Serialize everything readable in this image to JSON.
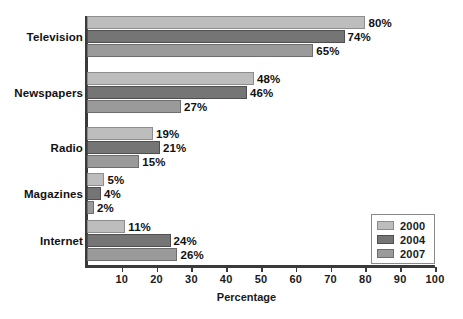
{
  "chart_data": {
    "type": "bar",
    "orientation": "horizontal",
    "title": "",
    "xlabel": "Percentage",
    "ylabel": "",
    "xlim": [
      0,
      100
    ],
    "xticks": [
      10,
      20,
      30,
      40,
      50,
      60,
      70,
      80,
      90,
      100
    ],
    "grid": false,
    "legend_position": "bottom-right",
    "categories": [
      "Television",
      "Newspapers",
      "Radio",
      "Magazines",
      "Internet"
    ],
    "series": [
      {
        "name": "2000",
        "color": "#bdbdbd",
        "values": [
          80,
          48,
          19,
          5,
          11
        ],
        "labels": [
          "80%",
          "48%",
          "19%",
          "5%",
          "11%"
        ]
      },
      {
        "name": "2004",
        "color": "#757575",
        "values": [
          74,
          46,
          21,
          4,
          24
        ],
        "labels": [
          "74%",
          "46%",
          "21%",
          "4%",
          "24%"
        ]
      },
      {
        "name": "2007",
        "color": "#9a9a9a",
        "values": [
          65,
          27,
          15,
          2,
          26
        ],
        "labels": [
          "65%",
          "27%",
          "15%",
          "2%",
          "26%"
        ]
      }
    ]
  },
  "axis": {
    "x_title": "Percentage",
    "tick_labels": [
      "10",
      "20",
      "30",
      "40",
      "50",
      "60",
      "70",
      "80",
      "90",
      "100"
    ]
  },
  "legend": {
    "items": [
      {
        "label": "2000"
      },
      {
        "label": "2004"
      },
      {
        "label": "2007"
      }
    ]
  }
}
